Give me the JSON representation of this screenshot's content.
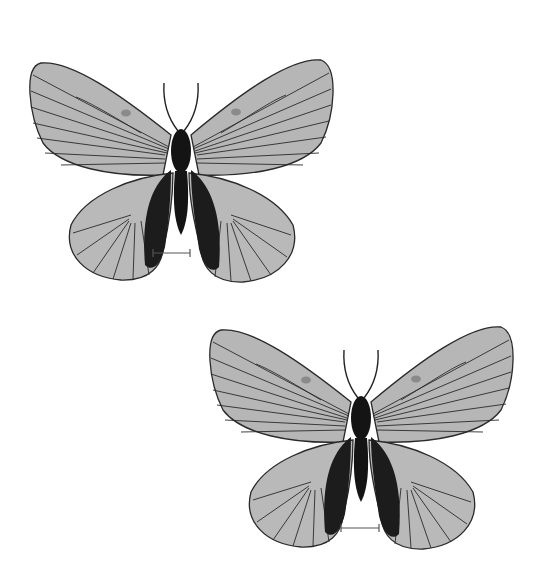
{
  "figure": {
    "background": "#ffffff",
    "description": "Two butterfly specimens (dorsal view), grayscale, each with a scale bar",
    "colors": {
      "wing_fill": "#b4b4b4",
      "wing_fill_light": "#c8c8c8",
      "vein": "#2a2a2a",
      "body": "#141414",
      "scale_bar": "#555555"
    },
    "specimens": [
      {
        "label": "specimen-1",
        "position": "upper-left",
        "scale_bar": "scale-bar-1"
      },
      {
        "label": "specimen-2",
        "position": "lower-right",
        "scale_bar": "scale-bar-2"
      }
    ]
  }
}
